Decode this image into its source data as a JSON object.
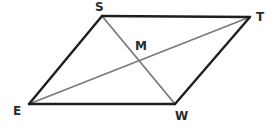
{
  "diagram": {
    "type": "parallelogram-with-diagonals",
    "colors": {
      "edge": "#1e1e1e",
      "diagonal": "#7a7a7a",
      "label": "#2a2a2a",
      "background": "#ffffff"
    },
    "vertices": {
      "S": {
        "label": "S",
        "x": 102,
        "y": 16
      },
      "T": {
        "label": "T",
        "x": 250,
        "y": 17
      },
      "W": {
        "label": "W",
        "x": 175,
        "y": 104
      },
      "E": {
        "label": "E",
        "x": 29,
        "y": 104
      }
    },
    "intersection": {
      "label": "M",
      "x": 138,
      "y": 60
    },
    "edges": [
      "ST",
      "TW",
      "WE",
      "ES"
    ],
    "diagonals": [
      "ET",
      "SW"
    ]
  }
}
